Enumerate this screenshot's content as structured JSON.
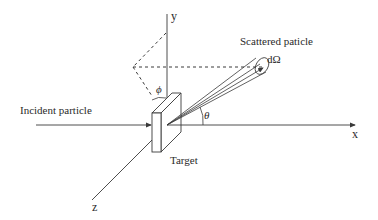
{
  "diagram": {
    "type": "particle-scattering-geometry",
    "axes": {
      "x_label": "x",
      "y_label": "y",
      "z_label": "z"
    },
    "labels": {
      "incident": "Incident particle",
      "scattered": "Scattered paticle",
      "solid_angle": "dΩ",
      "target": "Target",
      "phi": "ϕ",
      "theta": "θ"
    },
    "colors": {
      "line": "#3a3a3a",
      "background": "#ffffff"
    }
  }
}
